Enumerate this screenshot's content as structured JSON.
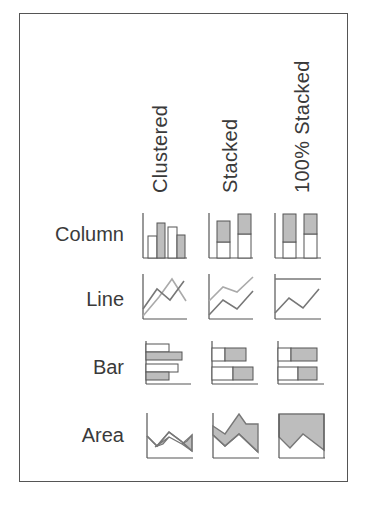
{
  "columns": [
    {
      "key": "clustered",
      "label": "Clustered"
    },
    {
      "key": "stacked",
      "label": "Stacked"
    },
    {
      "key": "percent_stacked",
      "label": "100% Stacked"
    }
  ],
  "rows": [
    {
      "key": "column",
      "label": "Column"
    },
    {
      "key": "line",
      "label": "Line"
    },
    {
      "key": "bar",
      "label": "Bar"
    },
    {
      "key": "area",
      "label": "Area"
    }
  ],
  "icons": [
    [
      "column-clustered-icon",
      "column-stacked-icon",
      "column-100-stacked-icon"
    ],
    [
      "line-clustered-icon",
      "line-stacked-icon",
      "line-100-stacked-icon"
    ],
    [
      "bar-clustered-icon",
      "bar-stacked-icon",
      "bar-100-stacked-icon"
    ],
    [
      "area-clustered-icon",
      "area-stacked-icon",
      "area-100-stacked-icon"
    ]
  ],
  "colors": {
    "outline": "#555555",
    "fill_gray": "#bdbdbd",
    "fill_white": "#ffffff",
    "text": "#3a3a3a"
  }
}
